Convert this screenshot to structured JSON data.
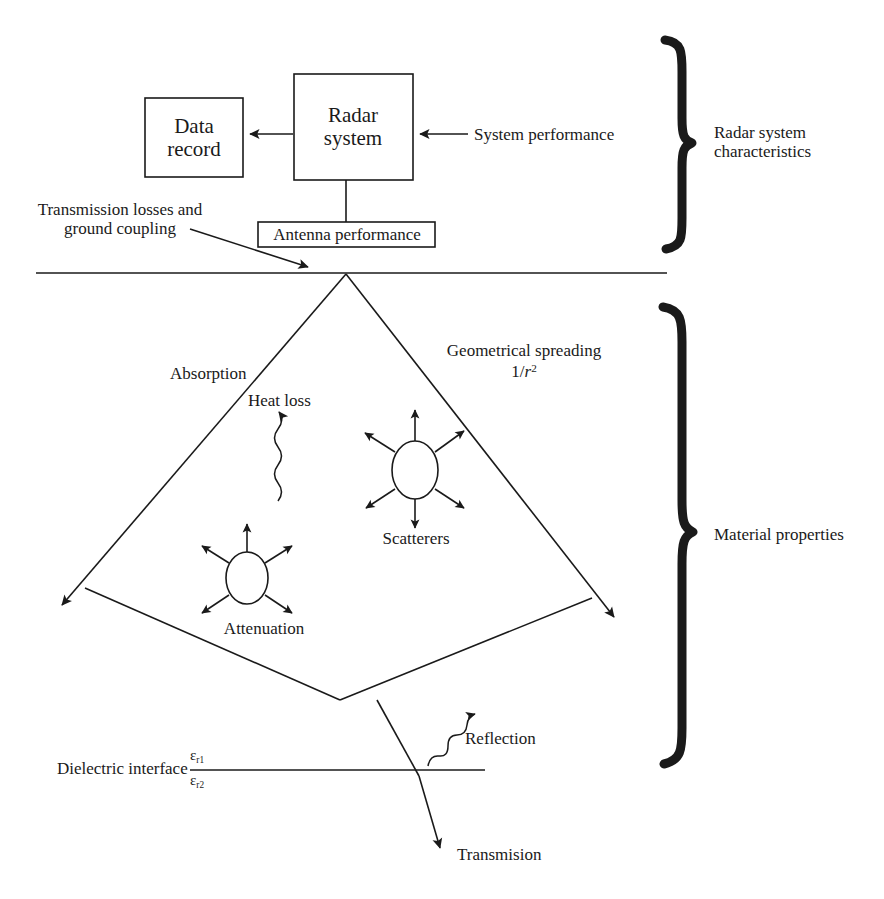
{
  "diagram": {
    "ink_color": "#1a1a1a"
  },
  "blocks": {
    "data_record": {
      "line1": "Data",
      "line2": "record"
    },
    "radar_system": {
      "line1": "Radar",
      "line2": "system"
    },
    "antenna_performance": {
      "label": "Antenna performance"
    }
  },
  "labels": {
    "system_performance": "System performance",
    "transmission_losses_line1": "Transmission losses and",
    "transmission_losses_line2": "ground coupling",
    "absorption": "Absorption",
    "heat_loss": "Heat loss",
    "geometrical_spreading": "Geometrical spreading",
    "geometrical_spreading_formula_num": "1/",
    "geometrical_spreading_formula_var": "r",
    "geometrical_spreading_formula_exp": "2",
    "scatterers": "Scatterers",
    "attenuation": "Attenuation",
    "dielectric_interface": "Dielectric interface",
    "epsilon_r1_sym": "ε",
    "epsilon_r1_sub": "r1",
    "epsilon_r2_sym": "ε",
    "epsilon_r2_sub": "r2",
    "reflection": "Reflection",
    "transmission": "Transmision"
  },
  "braces": {
    "radar_system_characteristics_line1": "Radar system",
    "radar_system_characteristics_line2": "characteristics",
    "material_properties": "Material properties"
  }
}
